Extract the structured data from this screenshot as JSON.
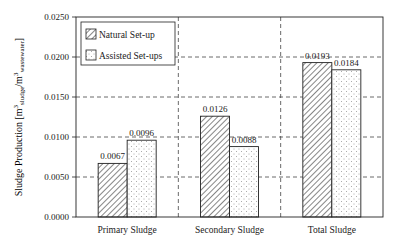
{
  "chart_data": {
    "type": "bar",
    "title": "",
    "xlabel": "",
    "ylabel": "Sludge Production [m3 sludge/m3 wastewater]",
    "ylabel_parts": {
      "main": "Sludge Production [m",
      "sup": "3",
      "sub1": "sludge",
      "mid": "/m",
      "sup2": "3",
      "sub2": "wastewater",
      "end": "]"
    },
    "ylim": [
      0,
      0.025
    ],
    "yticks": [
      "0.0000",
      "0.0050",
      "0.0100",
      "0.0150",
      "0.0200",
      "0.0250"
    ],
    "grid": true,
    "legend_position": "upper left",
    "categories": [
      "Primary Sludge",
      "Secondary Sludge",
      "Total Sludge"
    ],
    "series": [
      {
        "name": "Natural Set-up",
        "pattern": "diagonal-hatch",
        "values": [
          0.0067,
          0.0126,
          0.0193
        ],
        "labels": [
          "0.0067",
          "0.0126",
          "0.0193"
        ]
      },
      {
        "name": "Assisted Set-ups",
        "pattern": "dots",
        "values": [
          0.0096,
          0.0088,
          0.0184
        ],
        "labels": [
          "0.0096",
          "0.0088",
          "0.0184"
        ]
      }
    ]
  }
}
